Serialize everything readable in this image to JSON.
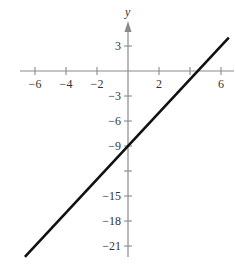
{
  "chart_data": {
    "type": "line",
    "title": "",
    "xlabel": "",
    "ylabel": "y",
    "xlim": [
      -7,
      7
    ],
    "ylim": [
      -23,
      5.5
    ],
    "x_ticks": [
      -6,
      -4,
      -2,
      2,
      4,
      6
    ],
    "x_tick_labels": [
      "−6",
      "−4",
      "−2",
      "2",
      "",
      "6"
    ],
    "y_ticks": [
      3,
      -3,
      -6,
      -9,
      -12,
      -15,
      -18,
      -21
    ],
    "y_tick_labels": [
      "3",
      "−3",
      "−6",
      "−9",
      "",
      "−15",
      "−18",
      "−21"
    ],
    "grid": false,
    "legend": null,
    "series": [
      {
        "name": "y = 2x − 9",
        "equation": "y = 2x - 9",
        "x": [
          -6.65,
          6.5
        ],
        "y": [
          -22.3,
          4
        ]
      }
    ],
    "annotations": {
      "y_intercept": [
        0,
        -9
      ],
      "x_intercept": [
        4.5,
        0
      ]
    }
  },
  "colors": {
    "axis": "#8a8a8a",
    "line": "#111111",
    "text": "#333333"
  }
}
